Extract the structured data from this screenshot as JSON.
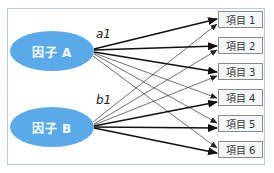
{
  "diagram": {
    "factors": [
      {
        "label": "因子 A",
        "loading_label": "a1",
        "color": "#5aa9e8"
      },
      {
        "label": "因子 B",
        "loading_label": "b1",
        "color": "#5aa9e8"
      }
    ],
    "items": [
      {
        "label": "項目 1"
      },
      {
        "label": "項目 2"
      },
      {
        "label": "項目 3"
      },
      {
        "label": "項目 4"
      },
      {
        "label": "項目 5"
      },
      {
        "label": "項目 6"
      }
    ],
    "paths": [
      {
        "from": "因子 A",
        "to": "項目 1",
        "weight": "strong"
      },
      {
        "from": "因子 A",
        "to": "項目 2",
        "weight": "strong"
      },
      {
        "from": "因子 A",
        "to": "項目 3",
        "weight": "strong"
      },
      {
        "from": "因子 A",
        "to": "項目 4",
        "weight": "weak"
      },
      {
        "from": "因子 A",
        "to": "項目 5",
        "weight": "weak"
      },
      {
        "from": "因子 A",
        "to": "項目 6",
        "weight": "weak"
      },
      {
        "from": "因子 B",
        "to": "項目 1",
        "weight": "weak"
      },
      {
        "from": "因子 B",
        "to": "項目 2",
        "weight": "weak"
      },
      {
        "from": "因子 B",
        "to": "項目 3",
        "weight": "weak"
      },
      {
        "from": "因子 B",
        "to": "項目 4",
        "weight": "strong"
      },
      {
        "from": "因子 B",
        "to": "項目 5",
        "weight": "strong"
      },
      {
        "from": "因子 B",
        "to": "項目 6",
        "weight": "strong"
      }
    ]
  }
}
